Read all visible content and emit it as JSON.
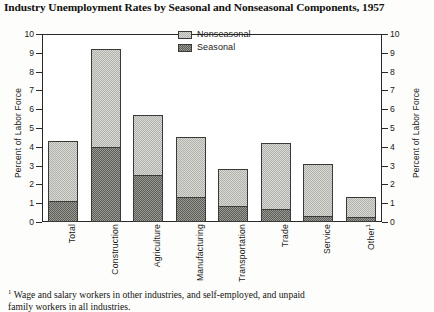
{
  "chart_data": {
    "type": "bar",
    "title": "Industry Unemployment Rates by Seasonal and Nonseasonal Components, 1957",
    "xlabel": "",
    "ylabel": "Percent of Labor Force",
    "ylabel_right": "Percent of Labor Force",
    "ylim": [
      0,
      10
    ],
    "yticks": [
      0,
      1,
      2,
      3,
      4,
      5,
      6,
      7,
      8,
      9,
      10
    ],
    "ytick_labels": [
      "0",
      "1",
      "2",
      "3",
      "4",
      "5",
      "6",
      "7",
      "8",
      "9",
      "10"
    ],
    "grid": false,
    "stacked": true,
    "legend_position": "inside-top-center",
    "categories": [
      "Total",
      "Construction",
      "Agriculture",
      "Manufacturing",
      "Transportation",
      "Trade",
      "Service",
      "Other"
    ],
    "category_footnote_marker": {
      "Other": "1"
    },
    "series": [
      {
        "name": "Seasonal",
        "color": "#6a6a65",
        "values": [
          1.1,
          4.0,
          2.5,
          1.35,
          0.85,
          0.7,
          0.3,
          0.25
        ]
      },
      {
        "name": "Nonseasonal",
        "color": "#d8d8d4",
        "values": [
          3.2,
          5.2,
          3.2,
          3.15,
          1.95,
          3.5,
          2.8,
          1.1
        ]
      }
    ],
    "totals": [
      4.3,
      9.2,
      5.7,
      4.5,
      2.8,
      4.2,
      3.1,
      1.35
    ]
  },
  "legend": {
    "items": [
      {
        "label": "Nonseasonal",
        "swatch": "nonseasonal"
      },
      {
        "label": "Seasonal",
        "swatch": "seasonal"
      }
    ]
  },
  "footnote": {
    "marker": "1",
    "line1": "Wage and salary workers in other industries, and self-employed, and unpaid",
    "line2": "family workers in all industries."
  }
}
